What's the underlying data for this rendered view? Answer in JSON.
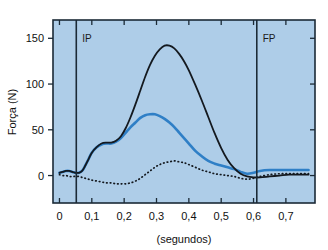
{
  "figure": {
    "background_color": "#ffffff",
    "plot_background_color": "#aecde8",
    "axis_color": "#1b2a36"
  },
  "chart_data": {
    "type": "line",
    "title": "",
    "subtitle": "",
    "xlabel": "(segundos)",
    "ylabel": "Força (N)",
    "xlim": [
      -0.02,
      0.79
    ],
    "ylim": [
      -30,
      170
    ],
    "grid": false,
    "legend": "none",
    "xticks": [
      0,
      0.1,
      0.2,
      0.3,
      0.4,
      0.5,
      0.6,
      0.7
    ],
    "xticklabels": [
      "0",
      "0,1",
      "0,2",
      "0,3",
      "0,4",
      "0,5",
      "0,6",
      "0,7"
    ],
    "yticks": [
      0,
      50,
      100,
      150
    ],
    "yticklabels": [
      "0",
      "50",
      "100",
      "150"
    ],
    "annotations": [
      {
        "name": "IP",
        "label": "IP",
        "x": 0.052,
        "type": "vertical-line",
        "label_y": 150
      },
      {
        "name": "FP",
        "label": "FP",
        "x": 0.61,
        "type": "vertical-line",
        "label_y": 150
      }
    ],
    "series": [
      {
        "name": "forca-vertical-preta",
        "color": "#14191f",
        "style": "solid",
        "width": 1.8,
        "x": [
          0.0,
          0.01,
          0.02,
          0.03,
          0.04,
          0.05,
          0.06,
          0.07,
          0.08,
          0.09,
          0.1,
          0.115,
          0.13,
          0.145,
          0.16,
          0.175,
          0.19,
          0.205,
          0.22,
          0.235,
          0.25,
          0.265,
          0.28,
          0.295,
          0.31,
          0.325,
          0.34,
          0.355,
          0.37,
          0.385,
          0.4,
          0.42,
          0.44,
          0.46,
          0.48,
          0.5,
          0.52,
          0.54,
          0.56,
          0.58,
          0.6,
          0.62,
          0.65,
          0.68,
          0.71,
          0.74,
          0.77
        ],
        "y": [
          3,
          4,
          5,
          5,
          4,
          3,
          3,
          5,
          11,
          18,
          25,
          31,
          35,
          36,
          36,
          38,
          43,
          52,
          64,
          78,
          93,
          108,
          121,
          131,
          138,
          142,
          142,
          139,
          133,
          125,
          115,
          99,
          82,
          64,
          46,
          30,
          17,
          8,
          2,
          -1,
          -2,
          -2,
          -1,
          0,
          1,
          1,
          1
        ]
      },
      {
        "name": "forca-antero-posterior-azul",
        "color": "#2f7fc6",
        "style": "solid",
        "width": 2.6,
        "x": [
          0.0,
          0.01,
          0.02,
          0.03,
          0.04,
          0.05,
          0.06,
          0.07,
          0.08,
          0.09,
          0.1,
          0.115,
          0.13,
          0.145,
          0.16,
          0.175,
          0.19,
          0.205,
          0.22,
          0.235,
          0.25,
          0.265,
          0.28,
          0.295,
          0.31,
          0.325,
          0.34,
          0.355,
          0.37,
          0.385,
          0.4,
          0.42,
          0.44,
          0.46,
          0.48,
          0.5,
          0.52,
          0.54,
          0.56,
          0.58,
          0.6,
          0.62,
          0.65,
          0.68,
          0.71,
          0.74,
          0.77
        ],
        "y": [
          3,
          4,
          5,
          5,
          4,
          3,
          3,
          5,
          11,
          18,
          25,
          31,
          34,
          35,
          35,
          37,
          41,
          47,
          53,
          58,
          63,
          66,
          67,
          67,
          65,
          62,
          58,
          53,
          47,
          41,
          35,
          27,
          21,
          16,
          13,
          11,
          9,
          7,
          4,
          2,
          3,
          5,
          6,
          6,
          6,
          6,
          6
        ]
      },
      {
        "name": "forca-medio-lateral-pontilhada",
        "color": "#14191f",
        "style": "dotted",
        "width": 1.7,
        "x": [
          0.0,
          0.01,
          0.02,
          0.03,
          0.04,
          0.05,
          0.06,
          0.07,
          0.08,
          0.09,
          0.1,
          0.115,
          0.13,
          0.145,
          0.16,
          0.175,
          0.19,
          0.205,
          0.22,
          0.235,
          0.25,
          0.265,
          0.28,
          0.295,
          0.31,
          0.325,
          0.34,
          0.355,
          0.37,
          0.385,
          0.4,
          0.42,
          0.44,
          0.46,
          0.48,
          0.5,
          0.52,
          0.54,
          0.56,
          0.58,
          0.6,
          0.62,
          0.65,
          0.68,
          0.71,
          0.74,
          0.77
        ],
        "y": [
          1,
          0,
          0,
          -1,
          -1,
          -1,
          -1,
          -2,
          -3,
          -4,
          -5,
          -6,
          -7,
          -8,
          -8,
          -9,
          -9,
          -9,
          -8,
          -6,
          -3,
          1,
          5,
          9,
          12,
          14,
          15,
          16,
          15,
          14,
          12,
          9,
          6,
          4,
          2,
          1,
          0,
          -1,
          -3,
          -4,
          -3,
          -1,
          1,
          2,
          2,
          2,
          2
        ]
      }
    ]
  }
}
